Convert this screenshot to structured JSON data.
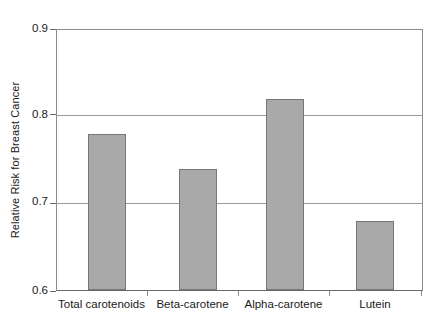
{
  "chart_data": {
    "type": "bar",
    "title": "",
    "subtitle": "",
    "xlabel": "",
    "ylabel": "Relative Risk for Breast Cancer",
    "categories": [
      "Total carotenoids",
      "Beta-carotene",
      "Alpha-carotene",
      "Lutein"
    ],
    "values": [
      0.78,
      0.74,
      0.82,
      0.68
    ],
    "series": [
      {
        "name": "Relative Risk for Breast Cancer",
        "values": [
          0.78,
          0.74,
          0.82,
          0.68
        ]
      }
    ],
    "ylim": [
      0.6,
      0.9
    ],
    "yticks": [
      0.6,
      0.7,
      0.8,
      0.9
    ],
    "ytick_labels": [
      "0.6",
      "0.7",
      "0.8",
      "0.9"
    ],
    "grid": "horizontal",
    "legend": "none",
    "annotations": [],
    "colors": {
      "bar_fill": "#a9a9a9",
      "bar_border": "#767676",
      "gridline": "#9a9a9a",
      "axis": "#8c8c8c",
      "text": "#1a1a1a",
      "background": "#ffffff"
    }
  }
}
